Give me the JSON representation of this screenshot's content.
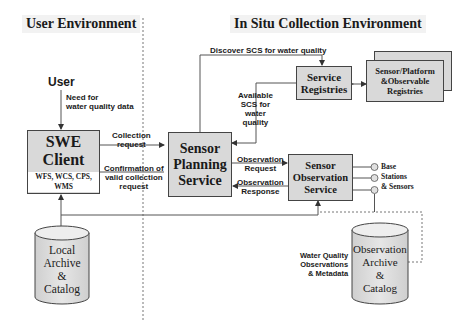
{
  "headings": {
    "left": "User Environment",
    "right": "In Situ Collection Environment"
  },
  "actors": {
    "user": "User"
  },
  "components": {
    "swe_client": {
      "title_lines": [
        "SWE",
        "Client"
      ],
      "subtitle": "WFS, WCS, CPS, WMS"
    },
    "sensor_planning_service": {
      "title_lines": [
        "Sensor",
        "Planning",
        "Service"
      ]
    },
    "service_registries": {
      "title_lines": [
        "Service",
        "Registries"
      ]
    },
    "sensor_platform_registries": {
      "title_lines": [
        "Sensor/Platform",
        "&Observable",
        "Registries"
      ]
    },
    "sensor_observation_service": {
      "title_lines": [
        "Sensor",
        "Observation",
        "Service"
      ]
    },
    "local_archive": {
      "title_lines": [
        "Local",
        "Archive",
        "&",
        "Catalog"
      ]
    },
    "observation_archive": {
      "title_lines": [
        "Observation",
        "Archive",
        "&",
        "Catalog"
      ]
    },
    "base_stations": {
      "label_lines": [
        "Base",
        "Stations",
        "& Sensors"
      ],
      "node_count": 3
    }
  },
  "flows": {
    "need_for_data": [
      "Need for",
      "water quality data"
    ],
    "collection_request": [
      "Collection",
      "request"
    ],
    "confirmation": [
      "Confirmation of",
      "valid collection",
      "request"
    ],
    "discover_scs": [
      "Discover SCS for water quality"
    ],
    "available_scs": [
      "Available",
      "SCS for",
      "water",
      "quality"
    ],
    "observation_request": [
      "Observation",
      "Request"
    ],
    "observation_response": [
      "Observation",
      "Response"
    ],
    "water_quality_observations": [
      "Water Quality",
      "Observations",
      "& Metadata"
    ]
  },
  "colors": {
    "box_fill": "#d9d9d9",
    "box_border": "#444444",
    "heading_bg": "#f2f2f2",
    "line": "#555555",
    "dashed": "#777777"
  }
}
